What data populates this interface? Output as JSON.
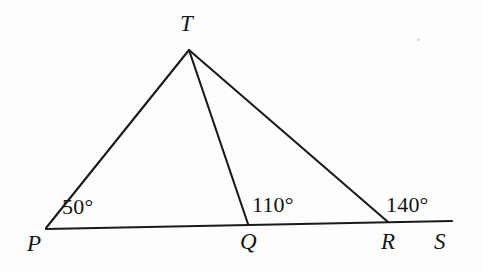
{
  "figure": {
    "background_color": "#fdfdfd",
    "stroke_color": "#1a1a1a",
    "text_color": "#141414"
  },
  "points": {
    "P": {
      "label": "P",
      "x": 46,
      "y": 228,
      "label_x": 27,
      "label_y": 232
    },
    "Q": {
      "label": "Q",
      "x": 248,
      "y": 224,
      "label_x": 240,
      "label_y": 230
    },
    "R": {
      "label": "R",
      "x": 388,
      "y": 222,
      "label_x": 381,
      "label_y": 230
    },
    "S": {
      "label": "S",
      "x": 452,
      "y": 221,
      "label_x": 434,
      "label_y": 230
    },
    "T": {
      "label": "T",
      "x": 189,
      "y": 50,
      "label_x": 180,
      "label_y": 12
    }
  },
  "segments": [
    {
      "name": "base-line-PS",
      "from": "P",
      "to": "S"
    },
    {
      "name": "side-PT",
      "from": "P",
      "to": "T"
    },
    {
      "name": "cevian-TQ",
      "from": "T",
      "to": "Q"
    },
    {
      "name": "side-TR",
      "from": "T",
      "to": "R"
    }
  ],
  "angles": [
    {
      "name": "angle-at-P",
      "value": "50°",
      "vertex": "P",
      "x": 62,
      "y": 196
    },
    {
      "name": "angle-at-Q",
      "value": "110°",
      "vertex": "Q",
      "x": 252,
      "y": 194
    },
    {
      "name": "angle-at-R",
      "value": "140°",
      "vertex": "R",
      "x": 386,
      "y": 194
    }
  ]
}
